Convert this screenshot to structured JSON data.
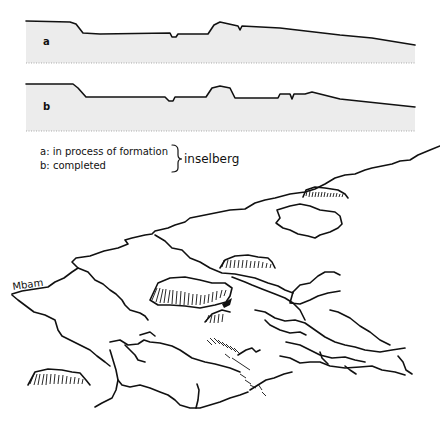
{
  "figure": {
    "profiles": [
      {
        "id": "a",
        "label": "a"
      },
      {
        "id": "b",
        "label": "b"
      }
    ],
    "legend": {
      "items": [
        {
          "key": "a",
          "text": "a: in process of formation"
        },
        {
          "key": "b",
          "text": "b: completed"
        }
      ],
      "group_label": "inselberg"
    },
    "map": {
      "river_label": "Mbam"
    }
  }
}
